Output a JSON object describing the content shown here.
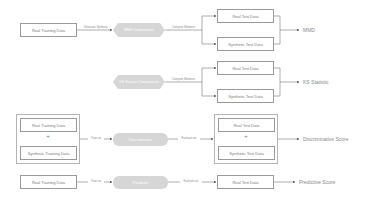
{
  "diagram": {
    "rows": [
      {
        "input": "Real Training Data",
        "edge_label": "Generate Synthetic",
        "process": "MMD Computation",
        "process_shape": "hexagon",
        "edge_label_2": "Compute Between",
        "targets": [
          "Real Test Data",
          "Synthetic Test Data"
        ],
        "output": "MMD"
      },
      {
        "process": "KS Statistic Computation",
        "process_shape": "hexagon",
        "edge_label_2": "Compute Between",
        "targets": [
          "Real Test Data",
          "Synthetic Test Data"
        ],
        "output": "KS Statistic"
      },
      {
        "inputs": [
          "Real Training Data",
          "Synthetic Training Data"
        ],
        "plus": "+",
        "edge_label": "Train on",
        "process": "Discriminator",
        "process_shape": "pill",
        "edge_label_2": "Evaluate on",
        "targets": [
          "Real Test Data",
          "Synthetic Test Data"
        ],
        "output": "Discriminative Score"
      },
      {
        "input": "Real Training Data",
        "edge_label": "Train on",
        "process": "Predictor",
        "process_shape": "pill",
        "edge_label_2": "Evaluate on",
        "targets": [
          "Real Test Data"
        ],
        "output": "Predictive Score"
      }
    ],
    "colors": {
      "box_border": "#9a9a9a",
      "process_fill": "#d6d6d6",
      "line": "#555555",
      "text": "#7a7a7a"
    }
  }
}
